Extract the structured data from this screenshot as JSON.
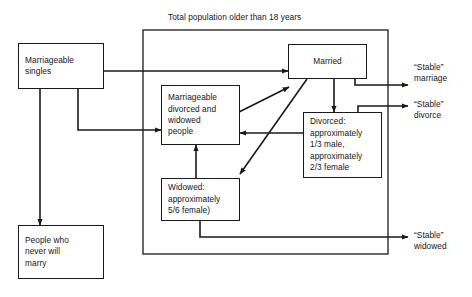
{
  "diagram": {
    "title": "Total population older than 18 years",
    "frame_label": "Total population older than 18 years",
    "colors": {
      "stroke": "#1a1a1a",
      "text": "#161616",
      "background": "#ffffff"
    },
    "nodes": {
      "marriageable_singles": "Marriageable\nsingles",
      "never_marry": "People who\nnever will\nmarry",
      "marriageable_divorced_widowed": "Marriageable\ndivorced and\nwidowed\npeople",
      "widowed": "Widowed:\napproximately\n5/6 female)",
      "married": "Married",
      "divorced": "Divorced:\napproximately\n1/3 male,\napproximately\n2/3 female"
    },
    "outcomes": {
      "stable_marriage": "“Stable”\nmarriage",
      "stable_divorce": "“Stable”\ndivorce",
      "stable_widowed": "“Stable”\nwidowed"
    },
    "edges": [
      {
        "from": "marriageable_singles",
        "to": "married",
        "style": "orthogonal"
      },
      {
        "from": "marriageable_singles",
        "to": "never_marry",
        "style": "vertical"
      },
      {
        "from": "marriageable_singles",
        "to": "marriageable_divorced_widowed",
        "style": "orthogonal"
      },
      {
        "from": "marriageable_divorced_widowed",
        "to": "married",
        "style": "diagonal"
      },
      {
        "from": "married",
        "to": "widowed",
        "style": "diagonal"
      },
      {
        "from": "married",
        "to": "divorced",
        "style": "vertical"
      },
      {
        "from": "divorced",
        "to": "marriageable_divorced_widowed",
        "style": "horizontal"
      },
      {
        "from": "widowed",
        "to": "marriageable_divorced_widowed",
        "style": "vertical"
      },
      {
        "from": "married",
        "to": "stable_marriage",
        "style": "orthogonal"
      },
      {
        "from": "divorced",
        "to": "stable_divorce",
        "style": "orthogonal"
      },
      {
        "from": "widowed",
        "to": "stable_widowed",
        "style": "orthogonal"
      }
    ]
  }
}
